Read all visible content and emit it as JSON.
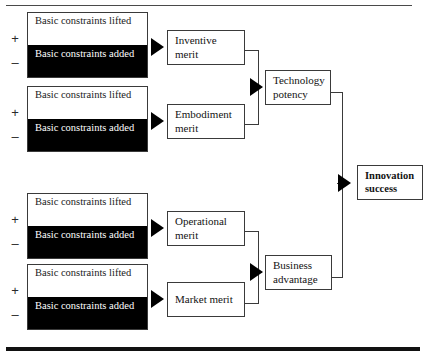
{
  "figure": {
    "title": "",
    "colors": {
      "line": "#3a3a3a",
      "fill_negative": "#000000",
      "fill_positive": "#ffffff",
      "text": "#131313",
      "rule": "#111111"
    }
  },
  "signs": {
    "positive": "+",
    "negative": "–"
  },
  "constraint_blocks": [
    {
      "id": "inventive",
      "lifted_label": "Basic constraints lifted",
      "added_label": "Basic constraints added"
    },
    {
      "id": "embodiment",
      "lifted_label": "Basic constraints lifted",
      "added_label": "Basic constraints added"
    },
    {
      "id": "operational",
      "lifted_label": "Basic constraints lifted",
      "added_label": "Basic constraints added"
    },
    {
      "id": "market",
      "lifted_label": "Basic constraints lifted",
      "added_label": "Basic constraints added"
    }
  ],
  "merit_boxes": [
    {
      "id": "inventive-merit",
      "label": "Inventive merit"
    },
    {
      "id": "embodiment-merit",
      "label": "Embodiment merit"
    },
    {
      "id": "operational-merit",
      "label": "Operational merit"
    },
    {
      "id": "market-merit",
      "label": "Market merit"
    }
  ],
  "intermediate_boxes": [
    {
      "id": "technology-potency",
      "label": "Technology potency"
    },
    {
      "id": "business-advantage",
      "label": "Business advantage"
    }
  ],
  "outcome_box": {
    "id": "innovation-success",
    "label": "Innovation success"
  }
}
